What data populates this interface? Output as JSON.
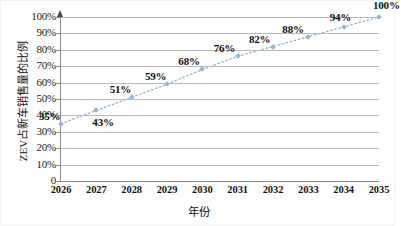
{
  "chart_data": {
    "type": "line",
    "title": "",
    "xlabel": "年份",
    "ylabel": "ZEV占新车销售量的比例",
    "categories": [
      "2026",
      "2027",
      "2028",
      "2029",
      "2030",
      "2031",
      "2032",
      "2033",
      "2034",
      "2035"
    ],
    "x": [
      2026,
      2027,
      2028,
      2029,
      2030,
      2031,
      2032,
      2033,
      2034,
      2035
    ],
    "values": [
      35,
      43,
      51,
      59,
      68,
      76,
      82,
      88,
      94,
      100
    ],
    "point_labels": [
      "35%",
      "43%",
      "51%",
      "59%",
      "68%",
      "76%",
      "82%",
      "88%",
      "94%",
      "100%"
    ],
    "ylim": [
      0,
      100
    ],
    "xlim": [
      2026,
      2035
    ],
    "ytick_labels": [
      "0",
      "10%",
      "20%",
      "30%",
      "40%",
      "50%",
      "60%",
      "70%",
      "80%",
      "90%",
      "100%"
    ],
    "ytick_values": [
      0,
      10,
      20,
      30,
      40,
      50,
      60,
      70,
      80,
      90,
      100
    ],
    "grid": true,
    "legend": "none",
    "series_color": "#8fb4de",
    "gridline_color": "#b9b9b9",
    "axis_color": "#8b8b8b",
    "line_style": "dotted",
    "marker": "diamond"
  },
  "axis": {
    "y_arrow_icon": "up-arrow-icon"
  }
}
